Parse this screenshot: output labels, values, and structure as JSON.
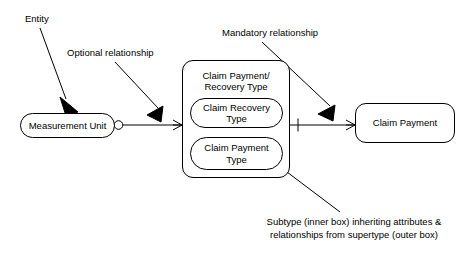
{
  "diagram": {
    "kind": "entity-relationship-diagram",
    "background_color": "#ffffff",
    "line_color": "#000000",
    "text_color": "#000000",
    "entities": {
      "measurement_unit": {
        "label": "Measurement Unit"
      },
      "supertype": {
        "label": "Claim Payment/\nRecovery Type"
      },
      "subtype_recovery": {
        "label": "Claim Recovery\nType"
      },
      "subtype_payment": {
        "label": "Claim Payment\nType"
      },
      "claim_payment": {
        "label": "Claim Payment"
      }
    },
    "annotations": {
      "entity": {
        "label": "Entity"
      },
      "optional_relationship": {
        "label": "Optional relationship"
      },
      "mandatory_relationship": {
        "label": "Mandatory relationship"
      },
      "subtype_caption": {
        "label": "Subtype (inner box) inheriting attributes &\nrelationships from supertype (outer box)"
      }
    },
    "notation": {
      "optional_marker": "circle",
      "mandatory_marker": "tick",
      "many_marker": "crows-foot"
    }
  }
}
